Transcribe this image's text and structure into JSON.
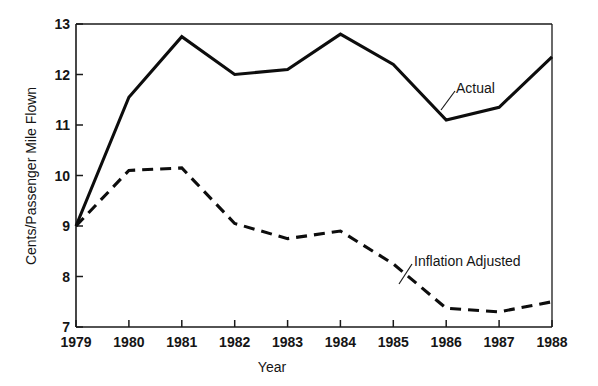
{
  "chart_data": {
    "type": "line",
    "title": "",
    "xlabel": "Year",
    "ylabel": "Cents/Passenger Mile Flown",
    "x": [
      1979,
      1980,
      1981,
      1982,
      1983,
      1984,
      1985,
      1986,
      1987,
      1988
    ],
    "xtick_labels": [
      "1979",
      "1980",
      "1981",
      "1982",
      "1983",
      "1984",
      "1985",
      "1986",
      "1987",
      "1988"
    ],
    "ytick_labels": [
      "7",
      "8",
      "9",
      "10",
      "11",
      "12",
      "13"
    ],
    "yticks": [
      7,
      8,
      9,
      10,
      11,
      12,
      13
    ],
    "xlim": [
      1979,
      1988
    ],
    "ylim": [
      7,
      13
    ],
    "grid": false,
    "legend_position": "inline-annotations",
    "series": [
      {
        "name": "Actual",
        "style": "solid",
        "color": "#0d0d0d",
        "values": [
          9.0,
          11.55,
          12.75,
          12.0,
          12.1,
          12.8,
          12.2,
          11.1,
          11.35,
          12.35
        ]
      },
      {
        "name": "Inflation Adjusted",
        "style": "dashed",
        "color": "#0d0d0d",
        "values": [
          9.0,
          10.1,
          10.15,
          9.05,
          8.75,
          8.9,
          8.25,
          7.37,
          7.3,
          7.5
        ]
      }
    ],
    "annotations": [
      {
        "text": "Actual",
        "series": "Actual",
        "x": 1985.6,
        "y": 11.9
      },
      {
        "text": "Inflation Adjusted",
        "series": "Inflation Adjusted",
        "x": 1985.6,
        "y": 8.2
      }
    ]
  }
}
